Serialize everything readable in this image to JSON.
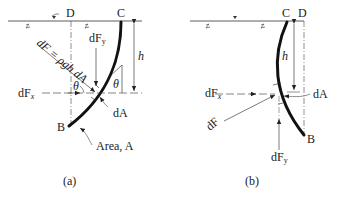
{
  "panel_a": {
    "caption": "(a)",
    "point_D": "D",
    "point_C": "C",
    "point_B": "B",
    "label_h": "h",
    "label_dF_eq": "dF = ρgh dA",
    "label_dFy": "dF",
    "label_dFy_sub": "y",
    "label_dFx": "dF",
    "label_dFx_sub": "x",
    "label_theta": "θ",
    "label_dA": "dA",
    "label_area": "Area, A"
  },
  "panel_b": {
    "caption": "(b)",
    "point_D": "D",
    "point_C": "C",
    "point_B": "B",
    "label_h": "h",
    "label_dF": "dF",
    "label_dFx": "dF",
    "label_dFx_sub": "x",
    "label_dFy": "dF",
    "label_dFy_sub": "y",
    "label_dA": "dA"
  },
  "colors": {
    "line": "#222222",
    "surface": "#333333"
  }
}
